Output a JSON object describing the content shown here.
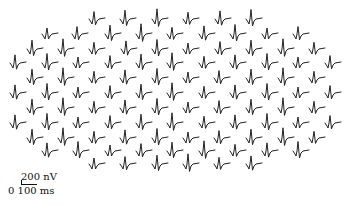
{
  "chart_data": {
    "type": "line",
    "title": "",
    "scale_bar": {
      "amplitude_label": "200 nV",
      "time_label_start": "0",
      "time_label_end": "100 ms"
    },
    "rows": [
      {
        "y": 20,
        "x": [
          97,
          128,
          160,
          191,
          223,
          254
        ]
      },
      {
        "y": 35,
        "x": [
          50,
          80,
          113,
          144,
          175,
          207,
          238,
          270,
          301
        ]
      },
      {
        "y": 50,
        "x": [
          35,
          66,
          97,
          129,
          160,
          191,
          223,
          254,
          286,
          317
        ]
      },
      {
        "y": 64,
        "x": [
          18,
          50,
          81,
          113,
          144,
          175,
          207,
          238,
          270,
          301,
          333
        ]
      },
      {
        "y": 79,
        "x": [
          35,
          66,
          97,
          128,
          160,
          191,
          222,
          254,
          286,
          317
        ]
      },
      {
        "y": 94,
        "x": [
          18,
          50,
          81,
          113,
          144,
          175,
          207,
          238,
          270,
          301,
          333
        ]
      },
      {
        "y": 109,
        "x": [
          35,
          66,
          97,
          128,
          160,
          191,
          222,
          254,
          286,
          317
        ]
      },
      {
        "y": 124,
        "x": [
          18,
          50,
          81,
          113,
          144,
          175,
          207,
          238,
          270,
          301,
          333
        ]
      },
      {
        "y": 139,
        "x": [
          35,
          66,
          97,
          128,
          160,
          191,
          222,
          254,
          286,
          317
        ]
      },
      {
        "y": 152,
        "x": [
          50,
          81,
          113,
          144,
          175,
          207,
          238,
          270,
          301
        ]
      },
      {
        "y": 165,
        "x": [
          97,
          128,
          160,
          191,
          222,
          254
        ]
      }
    ],
    "total_traces": 103
  },
  "labels": {
    "amplitude": "200 nV",
    "time": "0 100 ms"
  }
}
